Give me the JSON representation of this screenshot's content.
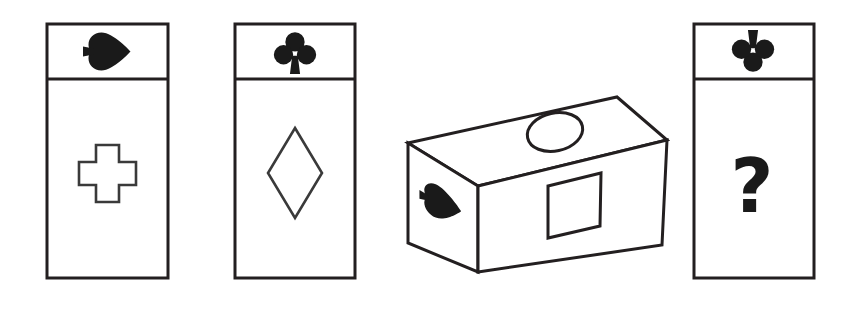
{
  "scene": {
    "title": "Visual reasoning puzzle: three cards, an isometric box, and an unknown card",
    "background_color": "#ffffff",
    "ink_color": "#1a1a1a",
    "stroke_color": "#231f20",
    "width": 851,
    "height": 317
  },
  "cards": [
    {
      "id": "card-1",
      "position": {
        "x": 47,
        "y": 24,
        "width": 121,
        "height": 254
      },
      "header": {
        "divider_y": 79,
        "suit_icon": "spade-icon",
        "suit_label": "spade",
        "rotation_degrees": 90,
        "orientation": "rotated-right"
      },
      "body": {
        "shape_icon": "cross-shape",
        "shape_label": "cross",
        "fill": "none",
        "outline": true
      }
    },
    {
      "id": "card-2",
      "position": {
        "x": 235,
        "y": 24,
        "width": 120,
        "height": 254
      },
      "header": {
        "divider_y": 79,
        "suit_icon": "club-icon",
        "suit_label": "club",
        "rotation_degrees": 0,
        "orientation": "upright"
      },
      "body": {
        "shape_icon": "diamond-shape",
        "shape_label": "diamond",
        "fill": "none",
        "outline": true
      }
    },
    {
      "id": "card-4",
      "position": {
        "x": 694,
        "y": 24,
        "width": 120,
        "height": 254
      },
      "header": {
        "divider_y": 79,
        "suit_icon": "club-icon",
        "suit_label": "club",
        "rotation_degrees": 180,
        "orientation": "inverted"
      },
      "body": {
        "shape_icon": "question-mark",
        "shape_label": "question mark",
        "text": "?",
        "fill": "solid",
        "outline": false
      }
    }
  ],
  "box": {
    "id": "isometric-box",
    "label": "isometric box",
    "faces": [
      {
        "name": "top-face",
        "marking_icon": "ellipse-shape",
        "marking_label": "ellipse",
        "outline": true,
        "fill": "none"
      },
      {
        "name": "left-face",
        "marking_icon": "spade-icon",
        "marking_label": "spade",
        "rotation_degrees": 90,
        "orientation": "rotated-right",
        "fill": "solid"
      },
      {
        "name": "front-face",
        "marking_icon": "square-shape",
        "marking_label": "square",
        "outline": true,
        "fill": "none"
      }
    ]
  }
}
